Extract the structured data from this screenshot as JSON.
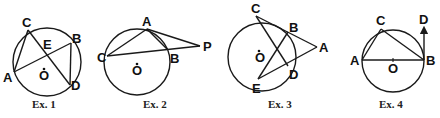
{
  "figures": [
    {
      "caption": "Ex. 1",
      "circle": {
        "cx": 47,
        "cy": 62,
        "r": 34
      },
      "points": {
        "A": [
          12,
          73
        ],
        "B": [
          70,
          43
        ],
        "C": [
          28,
          30
        ],
        "D": [
          70,
          85
        ],
        "E": [
          49,
          53
        ],
        "O": [
          47,
          62
        ]
      },
      "segments": [
        [
          "A",
          "B"
        ],
        [
          "C",
          "D"
        ],
        [
          "A",
          "C"
        ],
        [
          "B",
          "D"
        ]
      ],
      "labels": {
        "A": "A",
        "B": "B",
        "C": "C",
        "D": "D",
        "E": "E",
        "O": "O"
      }
    },
    {
      "caption": "Ex. 2",
      "circle": {
        "cx": 137,
        "cy": 62,
        "r": 33
      },
      "points": {
        "A": [
          147,
          29
        ],
        "B": [
          166,
          50
        ],
        "C": [
          106,
          56
        ],
        "P": [
          200,
          46
        ],
        "O": [
          137,
          62
        ]
      },
      "segments": [
        [
          "C",
          "A"
        ],
        [
          "A",
          "B"
        ],
        [
          "A",
          "P"
        ],
        [
          "C",
          "P"
        ]
      ],
      "labels": {
        "A": "A",
        "B": "B",
        "C": "C",
        "P": "P",
        "O": "O"
      }
    },
    {
      "caption": "Ex. 3",
      "circle": {
        "cx": 262,
        "cy": 58,
        "r": 33
      },
      "points": {
        "A": [
          318,
          47
        ],
        "B": [
          287,
          33
        ],
        "C": [
          256,
          15
        ],
        "D": [
          289,
          66
        ],
        "E": [
          258,
          80
        ],
        "O": [
          262,
          58
        ]
      },
      "segments": [
        [
          "C",
          "A"
        ],
        [
          "E",
          "A"
        ],
        [
          "C",
          "D"
        ],
        [
          "E",
          "B"
        ]
      ],
      "labels": {
        "A": "A",
        "B": "B",
        "C": "C",
        "D": "D",
        "E": "E",
        "O": "O"
      }
    },
    {
      "caption": "Ex. 4",
      "circle": {
        "cx": 393,
        "cy": 61,
        "r": 31
      },
      "points": {
        "A": [
          362,
          60
        ],
        "B": [
          424,
          60
        ],
        "C": [
          381,
          29
        ],
        "D": [
          424,
          26
        ],
        "O": [
          393,
          61
        ]
      },
      "segments": [
        [
          "A",
          "B"
        ],
        [
          "A",
          "C"
        ],
        [
          "C",
          "B"
        ]
      ],
      "arrows": [
        [
          "B",
          "D"
        ]
      ],
      "labels": {
        "A": "A",
        "B": "B",
        "C": "C",
        "D": "D",
        "O": "O"
      }
    }
  ]
}
